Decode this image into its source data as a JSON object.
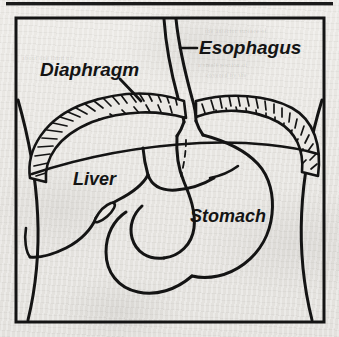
{
  "figure": {
    "kind": "anatomical-line-drawing",
    "background_color": "#e9e7e3",
    "ink_color": "#141414",
    "top_rule": true
  },
  "labels": {
    "esophagus": "Esophagus",
    "diaphragm": "Diaphragm",
    "liver": "Liver",
    "stomach": "Stomach"
  },
  "ghost_marks": [
    "the anterior surface of",
    "a small portion of",
    "covered by the",
    "about one third of"
  ],
  "structures": [
    {
      "name": "esophagus",
      "description": "narrow vertical tube entering from the top of the frame, curving slightly right and widening where it pierces the diaphragm"
    },
    {
      "name": "diaphragm",
      "description": "wide dome-shaped muscular band drawn as a crescent filled with dense hatching"
    },
    {
      "name": "liver",
      "description": "large organ below the left side of the diaphragm with a pointed gallbladder notch on its lower border"
    },
    {
      "name": "stomach",
      "description": "J-shaped organ below the diaphragm on the right continuing into the curving duodenum"
    },
    {
      "name": "body-wall-left",
      "description": "inward bowing line at the left of the frame"
    },
    {
      "name": "body-wall-right",
      "description": "inward bowing line at the right of the frame"
    }
  ]
}
